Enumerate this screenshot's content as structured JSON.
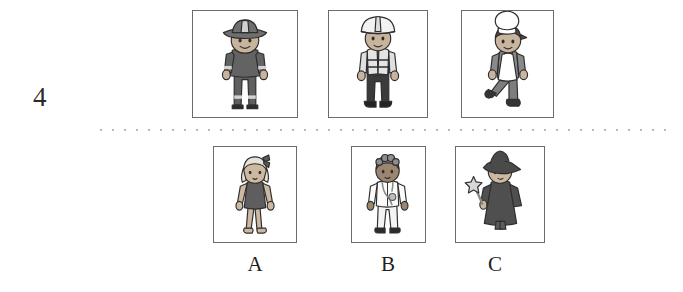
{
  "exercise": {
    "number": "4",
    "divider": "dotted-line"
  },
  "top_row": {
    "name": "occupation-pictures",
    "items": [
      {
        "id": "firefighter",
        "icon": "firefighter-figure",
        "description": "Person wearing a wide-brimmed firefighter helmet and a dark grey uniform with reflective bands on sleeves and trouser cuffs",
        "colors": {
          "skin": "#c8b49c",
          "hat": "#6f6f6f",
          "uniform": "#636363",
          "bands": "#d8d8d8",
          "outline": "#2e2e2e"
        }
      },
      {
        "id": "construction-worker",
        "icon": "construction-worker-figure",
        "description": "Person wearing a white hard hat, a light high-visibility vest with reflective stripes and dark trousers and boots",
        "colors": {
          "skin": "#c8b49c",
          "helmet": "#f2f2f2",
          "vest": "#e2e2e2",
          "shirt": "#555555",
          "trousers": "#3b3b3b",
          "boots": "#232323",
          "outline": "#2e2e2e"
        }
      },
      {
        "id": "chef",
        "icon": "chef-figure",
        "description": "Person wearing a tall white chef toque and a white apron over grey trousers, shown walking",
        "colors": {
          "skin": "#c9b59d",
          "toque": "#ffffff",
          "hair": "#5d4a3c",
          "apron": "#ffffff",
          "trousers": "#7e7e7e",
          "shoes": "#343434",
          "outline": "#2e2e2e"
        }
      }
    ]
  },
  "bottom_row": {
    "name": "answer-options",
    "items": [
      {
        "letter": "A",
        "id": "girl-in-dress",
        "icon": "girl-figure",
        "description": "Girl with light hair and a dark bow, wearing a dark sleeveless dress, with bare arms and legs",
        "colors": {
          "skin": "#cdb9a2",
          "hair": "#e8e2d6",
          "bow": "#5a5a5a",
          "dress": "#5e5e5e",
          "outline": "#2e2e2e"
        }
      },
      {
        "letter": "B",
        "id": "doctor",
        "icon": "doctor-figure",
        "description": "Person with curly hair wearing a white coat and trousers with a stethoscope around the neck",
        "colors": {
          "skin": "#9c8670",
          "hair": "#8e8e8e",
          "coat": "#fbfbfb",
          "trousers": "#f4f4f4",
          "stethoscope": "#8a8a8a",
          "shoes": "#2c2c2c",
          "outline": "#2e2e2e"
        }
      },
      {
        "letter": "C",
        "id": "wizard",
        "icon": "wizard-figure",
        "description": "Person wearing a dark pointed wizard hat and a long dark robe, holding a star-topped wand",
        "colors": {
          "skin": "#cdb9a2",
          "hat": "#4a4a4a",
          "robe": "#4f4f4f",
          "hair": "#ded6c8",
          "wand": "#8a8a8a",
          "star": "#d7d7d7",
          "outline": "#2e2e2e"
        }
      }
    ]
  }
}
